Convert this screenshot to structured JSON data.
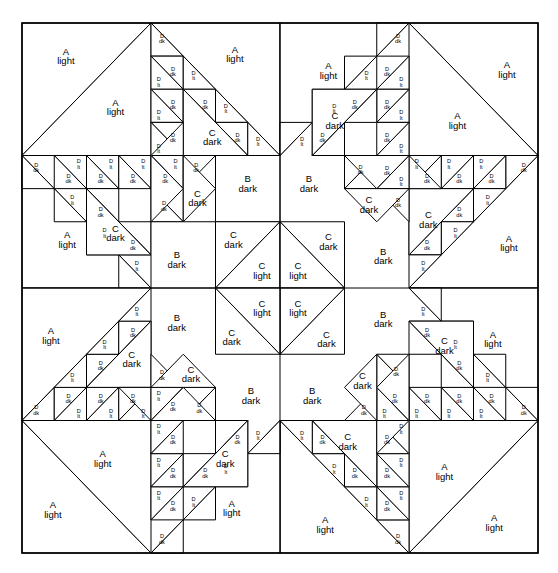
{
  "figure": {
    "kind": "quilt-block-piecing-diagram",
    "width": 558,
    "height": 573,
    "background_color": "#ffffff",
    "line_color": "#000000"
  },
  "block": {
    "x": 22,
    "y": 23,
    "width": 516,
    "height": 530,
    "quadrant_cols": 2,
    "quadrant_rows": 2,
    "grid_cols": 8,
    "grid_rows": 8
  },
  "patch_types": [
    {
      "code": "A",
      "shade": "light",
      "label_line1": "A",
      "label_line2": "light"
    },
    {
      "code": "B",
      "shade": "dark",
      "label_line1": "B",
      "label_line2": "dark"
    },
    {
      "code": "C",
      "shade": "dark",
      "label_line1": "C",
      "label_line2": "dark"
    },
    {
      "code": "C",
      "shade": "light",
      "label_line1": "C",
      "label_line2": "light"
    },
    {
      "code": "D",
      "shade": "dk",
      "label_line1": "D",
      "label_line2": "dk"
    },
    {
      "code": "D",
      "shade": "lt",
      "label_line1": "D",
      "label_line2": "lt"
    }
  ],
  "labels": {
    "a_light": {
      "l1": "A",
      "l2": "light"
    },
    "b_dark": {
      "l1": "B",
      "l2": "dark"
    },
    "c_dark": {
      "l1": "C",
      "l2": "dark"
    },
    "c_light": {
      "l1": "C",
      "l2": "light"
    },
    "d_dk": {
      "l1": "D",
      "l2": "dk"
    },
    "d_lt": {
      "l1": "D",
      "l2": "lt"
    }
  },
  "counts": {
    "a_light": 16,
    "b_dark": 8,
    "c_dark": 16,
    "c_light": 4,
    "d_dk": 48,
    "d_lt": 48
  },
  "quadrant_layout": {
    "note": "Each of the 4 quadrants is a 4x4 unit sub-block, rotated 90 degrees about the block centre",
    "units_per_side": 4
  }
}
